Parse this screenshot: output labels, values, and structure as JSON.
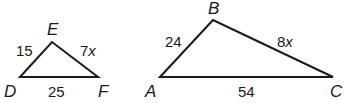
{
  "figure": {
    "triangles": [
      {
        "name": "DEF",
        "vertices": [
          {
            "id": "D",
            "label": "D",
            "x": 20,
            "y": 77,
            "lx": 4,
            "ly": 97
          },
          {
            "id": "E",
            "label": "E",
            "x": 52,
            "y": 42,
            "lx": 47,
            "ly": 35
          },
          {
            "id": "F",
            "label": "F",
            "x": 98,
            "y": 77,
            "lx": 98,
            "ly": 97
          }
        ],
        "sides": [
          {
            "id": "DE",
            "value": "15",
            "x": 16,
            "y": 56
          },
          {
            "id": "EF",
            "value": "7x",
            "num": "7",
            "var": "x",
            "x": 80,
            "y": 56
          },
          {
            "id": "DF",
            "value": "25",
            "x": 48,
            "y": 97
          }
        ]
      },
      {
        "name": "ABC",
        "vertices": [
          {
            "id": "A",
            "label": "A",
            "x": 160,
            "y": 77,
            "lx": 145,
            "ly": 97
          },
          {
            "id": "B",
            "label": "B",
            "x": 213,
            "y": 20,
            "lx": 208,
            "ly": 14
          },
          {
            "id": "C",
            "label": "C",
            "x": 333,
            "y": 77,
            "lx": 330,
            "ly": 97
          }
        ],
        "sides": [
          {
            "id": "AB",
            "value": "24",
            "x": 165,
            "y": 47
          },
          {
            "id": "BC",
            "value": "8x",
            "num": "8",
            "var": "x",
            "x": 277,
            "y": 47
          },
          {
            "id": "AC",
            "value": "54",
            "x": 238,
            "y": 97
          }
        ]
      }
    ],
    "colors": {
      "stroke": "#1a1a1a",
      "background": "#ffffff"
    }
  }
}
